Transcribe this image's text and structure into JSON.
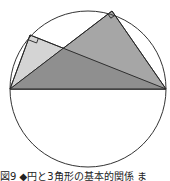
{
  "figure": {
    "caption": "図9 ◆円と3角形の基本的関係 ま",
    "circle": {
      "cx": 88,
      "cy": 89,
      "r": 78,
      "stroke": "#333333"
    },
    "diameter": {
      "x1": 10,
      "y1": 89,
      "x2": 166,
      "y2": 89
    },
    "triangles": [
      {
        "name": "left-right-triangle",
        "vertex": [
          30,
          35
        ],
        "fill": "#d4d4d4"
      },
      {
        "name": "top-right-triangle",
        "vertex": [
          112,
          11
        ],
        "fill": "#a6a6a6"
      }
    ],
    "overlap_fill": "#8f8f8f",
    "right_angle_markers": [
      "left-vertex",
      "top-vertex"
    ]
  }
}
